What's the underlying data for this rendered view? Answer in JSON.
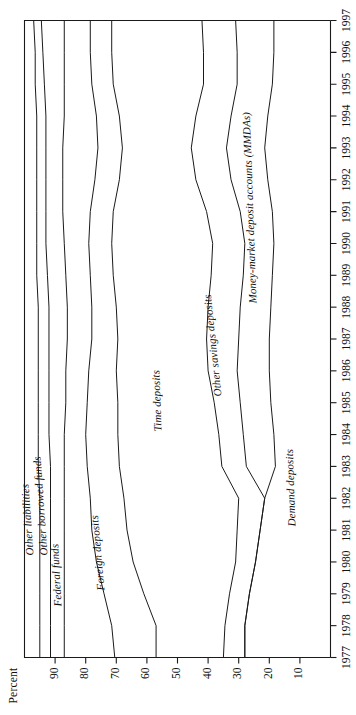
{
  "chart_data": {
    "type": "line",
    "title": "",
    "xlabel": "",
    "ylabel": "Percent",
    "orientation": "rotated-90-ccw",
    "grid": false,
    "legend_position": "inline-curve-labels",
    "xlim": [
      1977,
      1997
    ],
    "ylim": [
      0,
      100
    ],
    "yticks": [
      10,
      20,
      30,
      40,
      50,
      60,
      70,
      80,
      90
    ],
    "x": [
      1977,
      1978,
      1979,
      1980,
      1981,
      1982,
      1983,
      1984,
      1985,
      1986,
      1987,
      1988,
      1989,
      1990,
      1991,
      1992,
      1993,
      1994,
      1995,
      1996,
      1997
    ],
    "xticklabels": [
      "1977",
      "1978",
      "1979",
      "1980",
      "1981",
      "1982",
      "1983",
      "1984",
      "1985",
      "1986",
      "1987",
      "1988",
      "1989",
      "1990",
      "1991",
      "1992",
      "1993",
      "1994",
      "1995",
      "1996",
      "1997"
    ],
    "series": [
      {
        "name": "Demand deposits",
        "label": "Demand deposits",
        "cumulative_top": [
          28.0,
          28.0,
          26.5,
          24.5,
          23.0,
          21.5,
          18.0,
          18.5,
          19.5,
          20.0,
          20.0,
          19.5,
          19.0,
          18.5,
          19.0,
          20.5,
          21.5,
          20.5,
          19.0,
          18.5,
          18.5
        ]
      },
      {
        "name": "Money-market deposit accounts (MMDAs)",
        "label": "Money-market deposit accounts (MMDAs)",
        "cumulative_top": [
          28.0,
          28.0,
          26.5,
          24.5,
          23.0,
          21.5,
          27.5,
          28.5,
          29.5,
          30.5,
          30.0,
          29.5,
          28.5,
          28.0,
          29.5,
          32.5,
          34.0,
          32.5,
          30.5,
          30.5,
          31.0
        ]
      },
      {
        "name": "Other savings deposits",
        "label": "Other savings deposits",
        "cumulative_top": [
          35.0,
          34.5,
          33.0,
          31.0,
          30.5,
          30.0,
          35.5,
          36.5,
          38.0,
          40.0,
          40.5,
          40.0,
          39.0,
          38.5,
          40.5,
          44.0,
          45.5,
          44.0,
          41.5,
          41.5,
          42.0
        ]
      },
      {
        "name": "Time deposits",
        "label": "Time deposits",
        "cumulative_top": [
          57.0,
          57.0,
          61.0,
          64.5,
          66.5,
          67.5,
          69.0,
          69.5,
          69.5,
          70.0,
          69.5,
          70.0,
          71.0,
          71.5,
          71.0,
          69.0,
          68.0,
          69.0,
          71.0,
          71.5,
          71.5
        ]
      },
      {
        "name": "Foreign deposits",
        "label": "Foreign deposits",
        "cumulative_top": [
          70.5,
          71.5,
          74.0,
          76.5,
          78.0,
          78.5,
          79.5,
          80.0,
          79.5,
          79.0,
          78.0,
          78.0,
          78.5,
          79.0,
          78.5,
          77.0,
          76.0,
          76.5,
          78.0,
          78.5,
          78.5
        ]
      },
      {
        "name": "Federal funds",
        "label": "Federal funds",
        "cumulative_top": [
          87.0,
          87.0,
          87.0,
          87.0,
          87.0,
          87.0,
          87.0,
          87.0,
          86.5,
          86.5,
          86.0,
          86.0,
          86.5,
          87.0,
          87.5,
          87.5,
          87.5,
          87.0,
          87.0,
          87.0,
          87.0
        ]
      },
      {
        "name": "Other borrowed funds",
        "label": "Other borrowed funds",
        "cumulative_top": [
          91.5,
          91.5,
          91.5,
          91.5,
          91.5,
          91.5,
          91.5,
          92.0,
          92.0,
          92.0,
          92.0,
          92.0,
          92.5,
          93.0,
          93.0,
          93.0,
          93.0,
          93.0,
          93.5,
          94.0,
          94.5
        ]
      },
      {
        "name": "Other liabilities",
        "label": "Other liabilities",
        "cumulative_top": [
          95.0,
          95.0,
          95.0,
          95.0,
          95.0,
          95.0,
          95.5,
          95.5,
          95.5,
          95.5,
          95.5,
          95.5,
          96.0,
          96.0,
          96.0,
          96.0,
          96.0,
          96.0,
          96.5,
          96.5,
          97.0
        ]
      }
    ],
    "curve_labels": [
      "Other liabilities",
      "Other borrowed funds",
      "Federal funds",
      "Foreign deposits",
      "Time deposits",
      "Other savings deposits",
      "Money-market deposit accounts (MMDAs)",
      "Demand deposits"
    ]
  },
  "axes": {
    "ylabel": "Percent",
    "yticks": [
      "90",
      "80",
      "70",
      "60",
      "50",
      "40",
      "30",
      "20",
      "10"
    ],
    "xticks": [
      "1977",
      "1978",
      "1979",
      "1980",
      "1981",
      "1982",
      "1983",
      "1984",
      "1985",
      "1986",
      "1987",
      "1988",
      "1989",
      "1990",
      "1991",
      "1992",
      "1993",
      "1994",
      "1995",
      "1996",
      "1997"
    ]
  },
  "labels": {
    "other_liabilities": "Other liabilities",
    "other_borrowed_funds": "Other borrowed funds",
    "federal_funds": "Federal funds",
    "foreign_deposits": "Foreign deposits",
    "time_deposits": "Time deposits",
    "other_savings_deposits": "Other savings deposits",
    "mmda": "Money-market deposit accounts (MMDAs)",
    "demand_deposits": "Demand deposits"
  },
  "colors": {
    "line": "#1a1a1a",
    "axis": "#1a1a1a",
    "background": "#ffffff"
  }
}
